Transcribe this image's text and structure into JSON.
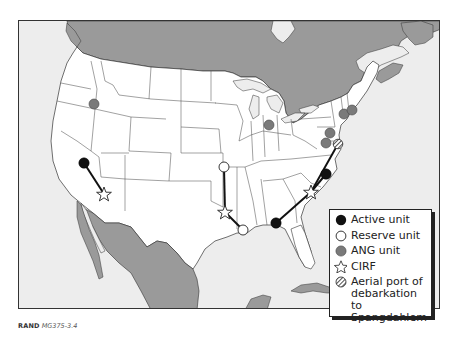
{
  "figure": {
    "caption_org": "RAND",
    "caption_id": "MG375-3.4"
  },
  "colors": {
    "ocean": "#ededed",
    "us_land": "#ffffff",
    "foreign_land": "#9a9a9a",
    "border": "#333333",
    "active": "#111111",
    "reserve": "#ffffff",
    "ang": "#7a7a7a"
  },
  "legend": {
    "items": [
      {
        "symbol": "filled-black-circle",
        "label": "Active unit"
      },
      {
        "symbol": "open-white-circle",
        "label": "Reserve unit"
      },
      {
        "symbol": "filled-gray-circle",
        "label": "ANG unit"
      },
      {
        "symbol": "open-star",
        "label": "CIRF"
      },
      {
        "symbol": "hatched-circle",
        "label": "Aerial port of\ndebarkation to\nSpangdahlem"
      }
    ]
  },
  "map": {
    "region": "Continental United States with Canada, Mexico and Cuba",
    "markers": {
      "ang_units": [
        {
          "x": 93,
          "y": 103
        },
        {
          "x": 268,
          "y": 124
        },
        {
          "x": 343,
          "y": 113
        },
        {
          "x": 351,
          "y": 109
        },
        {
          "x": 329,
          "y": 132
        },
        {
          "x": 325,
          "y": 142
        }
      ],
      "active_units": [
        {
          "x": 83,
          "y": 162
        },
        {
          "x": 275,
          "y": 222
        },
        {
          "x": 325,
          "y": 173
        }
      ],
      "reserve_units": [
        {
          "x": 223,
          "y": 166
        },
        {
          "x": 242,
          "y": 229
        }
      ],
      "cirf_sites": [
        {
          "x": 103,
          "y": 193
        },
        {
          "x": 224,
          "y": 211
        },
        {
          "x": 310,
          "y": 191
        }
      ],
      "aerial_port": [
        {
          "x": 337,
          "y": 143
        }
      ]
    },
    "links": [
      {
        "from": [
          83,
          162
        ],
        "to": [
          103,
          193
        ]
      },
      {
        "from": [
          223,
          166
        ],
        "to": [
          224,
          211
        ]
      },
      {
        "from": [
          242,
          229
        ],
        "to": [
          224,
          211
        ]
      },
      {
        "from": [
          275,
          222
        ],
        "to": [
          310,
          191
        ]
      },
      {
        "from": [
          325,
          173
        ],
        "to": [
          310,
          191
        ]
      },
      {
        "from": [
          337,
          143
        ],
        "to": [
          310,
          191
        ]
      }
    ]
  }
}
